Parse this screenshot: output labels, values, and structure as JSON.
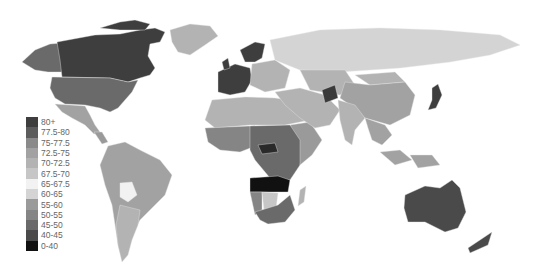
{
  "map": {
    "subject": "Life expectancy by country (grayscale choropleth)",
    "legend": [
      {
        "label": "80+",
        "color": "#3e3e3e"
      },
      {
        "label": "77.5-80",
        "color": "#5c5c5c"
      },
      {
        "label": "75-77.5",
        "color": "#8a8a8a"
      },
      {
        "label": "72.5-75",
        "color": "#a2a2a2"
      },
      {
        "label": "70-72.5",
        "color": "#b3b3b3"
      },
      {
        "label": "67.5-70",
        "color": "#c6c6c6"
      },
      {
        "label": "65-67.5",
        "color": "#f2f2f2"
      },
      {
        "label": "60-65",
        "color": "#d4d4d4"
      },
      {
        "label": "55-60",
        "color": "#9a9a9a"
      },
      {
        "label": "50-55",
        "color": "#858585"
      },
      {
        "label": "45-50",
        "color": "#6a6a6a"
      },
      {
        "label": "40-45",
        "color": "#4a4a4a"
      },
      {
        "label": "0-40",
        "color": "#111111"
      }
    ],
    "regions": {
      "canada": "#3e3e3e",
      "usa": "#6a6a6a",
      "alaska": "#6a6a6a",
      "greenland": "#b3b3b3",
      "mexico": "#a2a2a2",
      "central_america": "#9a9a9a",
      "south_america": "#a2a2a2",
      "bolivia": "#f2f2f2",
      "argentina": "#b3b3b3",
      "western_europe": "#3e3e3e",
      "eastern_europe": "#b3b3b3",
      "russia": "#d4d4d4",
      "north_africa": "#b3b3b3",
      "west_africa": "#858585",
      "central_africa": "#6a6a6a",
      "car": "#2a2a2a",
      "east_africa": "#9a9a9a",
      "angola_zambia": "#111111",
      "namibia": "#858585",
      "botswana": "#c6c6c6",
      "south_africa": "#6a6a6a",
      "madagascar": "#b3b3b3",
      "middle_east": "#b3b3b3",
      "afghanistan": "#3a3a3a",
      "central_asia": "#b3b3b3",
      "china": "#a2a2a2",
      "mongolia": "#b3b3b3",
      "india": "#b3b3b3",
      "se_asia": "#a2a2a2",
      "indonesia": "#a2a2a2",
      "japan": "#3e3e3e",
      "australia": "#4a4a4a",
      "new_zealand": "#4a4a4a"
    }
  }
}
